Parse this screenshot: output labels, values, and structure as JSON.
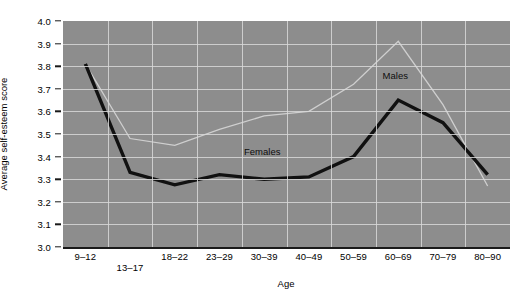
{
  "chart_data": {
    "type": "line",
    "title": "",
    "xlabel": "Age",
    "ylabel": "Average self-esteem score",
    "categories": [
      "9–12",
      "13–17",
      "18–22",
      "23–29",
      "30–39",
      "40–49",
      "50–59",
      "60–69",
      "70–79",
      "80–90"
    ],
    "ylim": [
      3.0,
      4.0
    ],
    "ytick_labels": [
      "4.0",
      "3.9",
      "3.8",
      "3.7",
      "3.6",
      "3.5",
      "3.4",
      "3.3",
      "3.2",
      "3.1",
      "3.0"
    ],
    "ytick_values": [
      4.0,
      3.9,
      3.8,
      3.7,
      3.6,
      3.5,
      3.4,
      3.3,
      3.2,
      3.1,
      3.0
    ],
    "grid": true,
    "legend_position": "inline-annotations",
    "series": [
      {
        "name": "Females",
        "color": "#111111",
        "width": 3.4,
        "values": [
          3.81,
          3.33,
          3.275,
          3.32,
          3.3,
          3.31,
          3.4,
          3.65,
          3.55,
          3.32
        ]
      },
      {
        "name": "Males",
        "color": "#cfcfcf",
        "width": 1.3,
        "values": [
          3.81,
          3.48,
          3.45,
          3.52,
          3.58,
          3.6,
          3.72,
          3.91,
          3.63,
          3.27
        ]
      }
    ],
    "annotations": [
      {
        "text": "Females",
        "series": "Females",
        "x_pct": 40.5,
        "y_pct": 55.5
      },
      {
        "text": "Males",
        "series": "Males",
        "x_pct": 71.5,
        "y_pct": 21.5
      }
    ],
    "plot_background": "#8d8d8d",
    "grid_color": "#d8d8d8",
    "page_background": "#ffffff"
  }
}
